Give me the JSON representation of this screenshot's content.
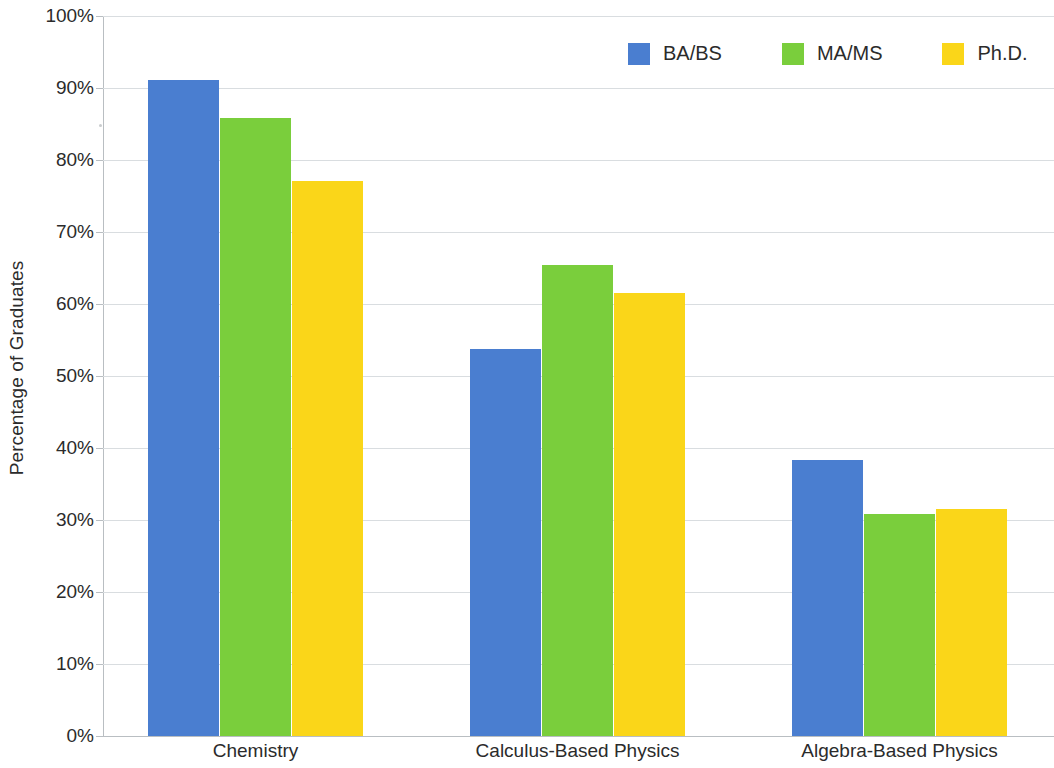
{
  "chart_data": {
    "type": "bar",
    "title": "",
    "subtitle": "",
    "xlabel": "",
    "ylabel": "Percentage of Graduates",
    "categories": [
      "Chemistry",
      "Calculus-Based Physics",
      "Algebra-Based Physics"
    ],
    "series": [
      {
        "name": "BA/BS",
        "color": "#4a7ed0",
        "values": [
          91.1,
          53.7,
          38.3
        ]
      },
      {
        "name": "MA/MS",
        "color": "#7ace3c",
        "values": [
          85.9,
          65.4,
          30.8
        ]
      },
      {
        "name": "Ph.D.",
        "color": "#fad619",
        "values": [
          77.1,
          61.5,
          31.5
        ]
      }
    ],
    "ylim": [
      0,
      100
    ],
    "y_tick_values": [
      0,
      10,
      20,
      30,
      40,
      50,
      60,
      70,
      80,
      90,
      100
    ],
    "y_tick_labels": [
      "0%",
      "10%",
      "20%",
      "30%",
      "40%",
      "50%",
      "60%",
      "70%",
      "80%",
      "90%",
      "100%"
    ],
    "grid": true,
    "grid_axis": "y",
    "legend_position": "top-right",
    "value_format": "percent"
  },
  "legend": {
    "items": [
      {
        "label": "BA/BS",
        "color": "#4a7ed0"
      },
      {
        "label": "MA/MS",
        "color": "#7ace3c"
      },
      {
        "label": "Ph.D.",
        "color": "#fad619"
      }
    ]
  },
  "axis": {
    "y_title": "Percentage of Graduates"
  },
  "colors": {
    "series_blue": "#4a7ed0",
    "series_green": "#7ace3c",
    "series_yellow": "#fad619",
    "gridline": "#d9dde0",
    "axis_line": "#b9bec2",
    "text": "#2b2b2b",
    "background": "#ffffff"
  }
}
